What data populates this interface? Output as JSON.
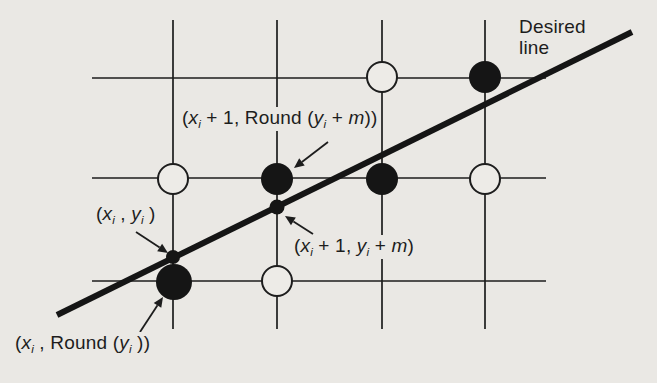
{
  "colors": {
    "background": "#eae8e4",
    "paper_fill": "#edebe7",
    "ink": "#1d1d1d",
    "thick_line": "#151515"
  },
  "desired_line_label": {
    "line1": "Desired",
    "line2": "line"
  },
  "labels": {
    "round_next": {
      "meaning": "(xi + 1, Round (yi + m))",
      "parts": [
        {
          "t": "("
        },
        {
          "t": "x",
          "i": true
        },
        {
          "t": "i",
          "i": true,
          "sub": true
        },
        {
          "t": " + 1, Round ("
        },
        {
          "t": "y",
          "i": true
        },
        {
          "t": "i",
          "i": true,
          "sub": true
        },
        {
          "t": " + "
        },
        {
          "t": "m",
          "i": true
        },
        {
          "t": "))"
        }
      ]
    },
    "current_point": {
      "meaning": "(xi , yi )",
      "parts": [
        {
          "t": "("
        },
        {
          "t": "x",
          "i": true
        },
        {
          "t": "i",
          "i": true,
          "sub": true
        },
        {
          "t": " , "
        },
        {
          "t": "y",
          "i": true
        },
        {
          "t": "i",
          "i": true,
          "sub": true
        },
        {
          "t": " )"
        }
      ]
    },
    "next_point": {
      "meaning": "(xi + 1, yi + m)",
      "parts": [
        {
          "t": "("
        },
        {
          "t": "x",
          "i": true
        },
        {
          "t": "i",
          "i": true,
          "sub": true
        },
        {
          "t": " + 1, "
        },
        {
          "t": "y",
          "i": true
        },
        {
          "t": "i",
          "i": true,
          "sub": true
        },
        {
          "t": " + "
        },
        {
          "t": "m",
          "i": true
        },
        {
          "t": ")"
        }
      ]
    },
    "round_current": {
      "meaning": "(xi , Round (yi ))",
      "parts": [
        {
          "t": "("
        },
        {
          "t": "x",
          "i": true
        },
        {
          "t": "i",
          "i": true,
          "sub": true
        },
        {
          "t": " , Round ("
        },
        {
          "t": "y",
          "i": true
        },
        {
          "t": "i",
          "i": true,
          "sub": true
        },
        {
          "t": " ))"
        }
      ]
    }
  },
  "figure": {
    "grid": {
      "vertical_x": [
        173,
        277,
        382,
        485
      ],
      "vertical_y_top": 20,
      "vertical_y_bottom": 329,
      "horizontal_y": [
        78,
        178,
        281
      ],
      "horizontal_x_left": 92,
      "horizontal_x_right": 546
    },
    "desired_line": {
      "x1": 57,
      "y1": 315,
      "x2": 632,
      "y2": 32,
      "width": 6
    },
    "circles": [
      {
        "cx": 382,
        "cy": 77,
        "r": 15,
        "type": "open"
      },
      {
        "cx": 485,
        "cy": 77,
        "r": 16,
        "type": "filled"
      },
      {
        "cx": 173,
        "cy": 179,
        "r": 15,
        "type": "open"
      },
      {
        "cx": 277,
        "cy": 179,
        "r": 16,
        "type": "filled"
      },
      {
        "cx": 382,
        "cy": 179,
        "r": 16,
        "type": "filled"
      },
      {
        "cx": 485,
        "cy": 179,
        "r": 15,
        "type": "open"
      },
      {
        "cx": 174,
        "cy": 282,
        "r": 18,
        "type": "filled"
      },
      {
        "cx": 277,
        "cy": 281,
        "r": 15,
        "type": "open"
      }
    ],
    "dots": [
      {
        "cx": 173,
        "cy": 257,
        "r": 7
      },
      {
        "cx": 277,
        "cy": 207,
        "r": 7.5
      }
    ],
    "arrows": [
      {
        "x1": 328,
        "y1": 142,
        "x2": 294,
        "y2": 168
      },
      {
        "x1": 136,
        "y1": 232,
        "x2": 168,
        "y2": 253
      },
      {
        "x1": 313,
        "y1": 234,
        "x2": 285,
        "y2": 216
      },
      {
        "x1": 140,
        "y1": 332,
        "x2": 163,
        "y2": 297
      }
    ]
  }
}
